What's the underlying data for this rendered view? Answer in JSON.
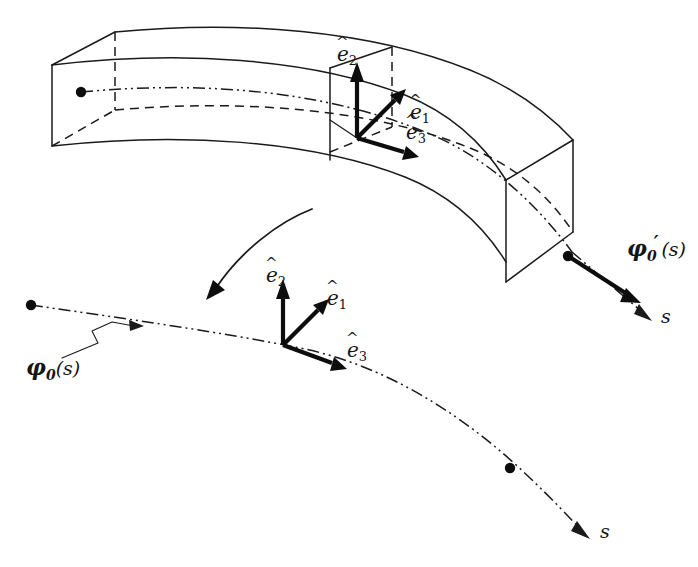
{
  "figure": {
    "kind": "technical-line-diagram",
    "background_color": "#ffffff",
    "line_color": "#1a1a1a",
    "width": 698,
    "height": 567
  },
  "labels": {
    "upper_triad": {
      "e1": {
        "base": "e",
        "sub": "1",
        "accent": "hat",
        "text": "ê1"
      },
      "e2": {
        "base": "e",
        "sub": "2",
        "accent": "hat",
        "text": "ê2"
      },
      "e3": {
        "base": "e",
        "sub": "3",
        "accent": "hat",
        "text": "ê3"
      }
    },
    "lower_triad": {
      "e1": {
        "base": "e",
        "sub": "1",
        "accent": "hat",
        "text": "ê1"
      },
      "e2": {
        "base": "e",
        "sub": "2",
        "accent": "hat",
        "text": "ê2"
      },
      "e3": {
        "base": "e",
        "sub": "3",
        "accent": "hat",
        "text": "ê3"
      }
    },
    "tangent_vector": {
      "base": "φ",
      "sub": "0",
      "prime": "′",
      "arg": "(s)",
      "text": "φ'0(s)"
    },
    "centerline_function": {
      "base": "φ",
      "sub": "0",
      "arg": "(s)",
      "text": "φ0(s)"
    },
    "arclength_beam": "s",
    "arclength_curve": "s"
  },
  "geometry": {
    "beam": {
      "description": "Slightly curved prismatic beam drawn in axonometric projection with hidden edges dashed",
      "top_face_front_edge": "M 52,65 C 170,32 330,32 455,62 L 455,62",
      "left_end_face": [
        [
          52,
          65
        ],
        [
          115,
          32
        ],
        [
          115,
          110
        ],
        [
          52,
          146
        ]
      ],
      "right_end_face": [
        [
          506,
          180
        ],
        [
          573,
          140
        ],
        [
          573,
          232
        ],
        [
          506,
          282
        ]
      ],
      "cross_section_plane_x": 330
    },
    "centerline_3d": {
      "start_point": [
        81,
        92
      ],
      "end_point": [
        570,
        257
      ],
      "style": "dash-dot"
    },
    "centerline_2d": {
      "start_point": [
        31,
        305
      ],
      "mid_point": [
        298,
        343
      ],
      "end_point": [
        586,
        535
      ],
      "marker_point": [
        510,
        468
      ],
      "style": "dash-dot"
    },
    "rotation_arrow": {
      "from": [
        312,
        209
      ],
      "to": [
        209,
        297
      ],
      "style": "curved single-headed arrow"
    },
    "leader_line": {
      "from": [
        85,
        354
      ],
      "to": [
        138,
        326
      ],
      "style": "zigzag"
    }
  },
  "vectors": {
    "upper_triad_origin": [
      357,
      138
    ],
    "lower_triad_origin": [
      283,
      345
    ],
    "directions": {
      "e1": "up-right diagonal",
      "e2": "vertical up",
      "e3": "right, slightly down"
    }
  },
  "colors": {
    "ink": "#1a1a1a",
    "vector_ink": "#0d0d0d",
    "paper": "#ffffff"
  }
}
